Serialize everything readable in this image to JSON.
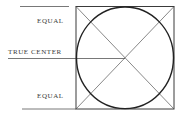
{
  "diagram": {
    "labels": {
      "equal_top": "EQUAL",
      "true_center": "TRUE CENTER",
      "equal_bottom": "EQUAL"
    },
    "colors": {
      "line": "#3a3a3a",
      "circle": "#222222",
      "background": "#ffffff"
    },
    "square": {
      "x": 76,
      "y": 6,
      "width": 98,
      "height": 102
    },
    "circle": {
      "cx": 125,
      "cy": 57.5,
      "rx": 48.5,
      "ry": 50.5
    },
    "center_point": {
      "x": 125,
      "y": 58
    }
  }
}
